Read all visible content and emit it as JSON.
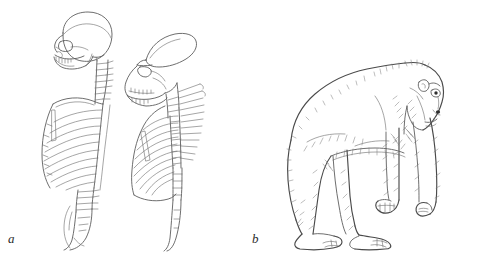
{
  "figure": {
    "background_color": "#ffffff",
    "ink_color": "#5d5d5d",
    "width": 494,
    "height": 262,
    "style": "pen-and-ink line drawing"
  },
  "panels": [
    {
      "id": "a",
      "label": "a",
      "caption_text": "a",
      "subject": "comparative lateral view of human and ape axial skeletons",
      "specimens": [
        {
          "name": "human-axial-skeleton",
          "description": "human skull, cervical vertebrae, thoracic cage and curved lumbar spine in left lateral view",
          "features": [
            "rounded cranium",
            "vertical face",
            "barrel-shaped rib cage",
            "long lumbar region",
            "lumbar lordosis",
            "sacrum and coccyx"
          ]
        },
        {
          "name": "ape-axial-skeleton",
          "description": "ape skull, cervical vertebrae, funnel-shaped thoracic cage and short straight lumbar spine in left lateral view",
          "features": [
            "low sloping cranium",
            "prognathic muzzle",
            "funnel-shaped rib cage",
            "long spinous processes",
            "short lumbar region",
            "straight vertebral column"
          ]
        }
      ]
    },
    {
      "id": "b",
      "label": "b",
      "caption_text": "b",
      "subject": "gorilla in knuckle-walking quadrupedal stance, facing right",
      "specimens": [
        {
          "name": "gorilla-knuckle-walking",
          "description": "adult gorilla standing on all fours with weight borne on the knuckles of the forelimbs",
          "features": [
            "sloping back",
            "long forelimbs",
            "knuckle-walking hands",
            "plantigrade hind feet",
            "shaggy fur hatching",
            "head in right profile"
          ]
        }
      ]
    }
  ],
  "labels": {
    "panel_a": "a",
    "panel_b": "b"
  }
}
